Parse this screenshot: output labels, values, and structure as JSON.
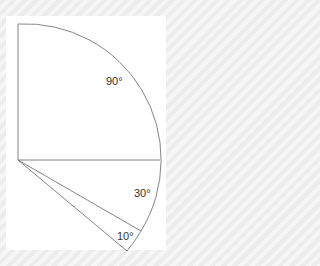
{
  "diagram": {
    "title": "",
    "type": "angle-fan",
    "center": {
      "x": 18,
      "y": 160
    },
    "radius": 142,
    "sectors": [
      {
        "label": "90°",
        "start_deg": 0,
        "end_deg": 90
      },
      {
        "label": "30°",
        "start_deg": 0,
        "end_deg": -30
      },
      {
        "label": "10°",
        "start_deg": -30,
        "end_deg": -40
      }
    ],
    "colors": {
      "stroke": "#777777",
      "panel": "#ffffff",
      "text": "#333333"
    }
  }
}
